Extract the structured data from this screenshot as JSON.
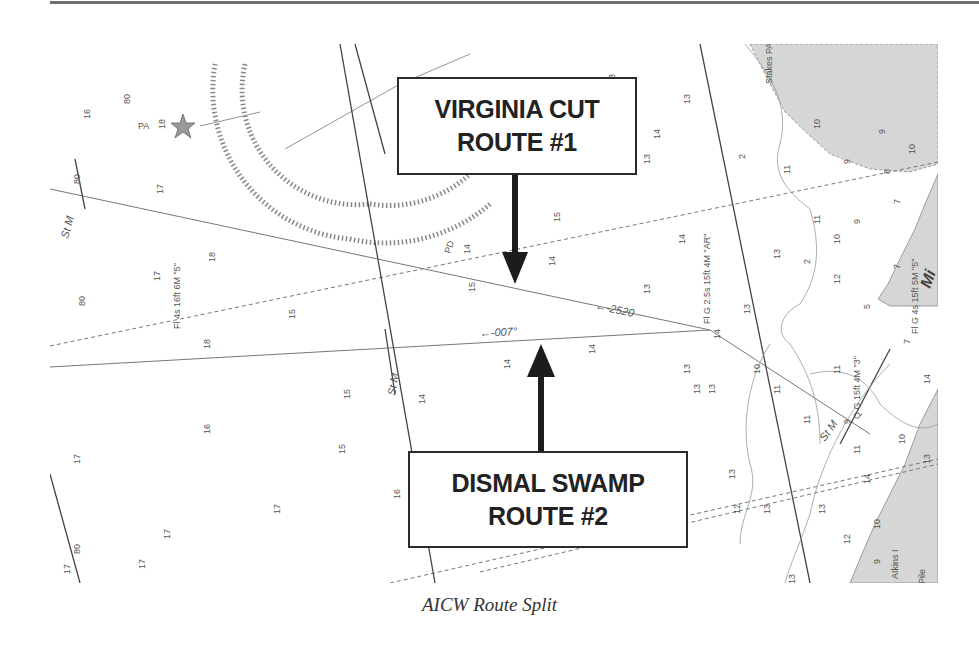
{
  "figure": {
    "caption": "AICW Route Split",
    "colors": {
      "land": "#d6d6d6",
      "water": "#ffffff",
      "ink": "#222222",
      "rule": "#6f6f6f"
    }
  },
  "callouts": [
    {
      "id": "route1",
      "line1": "VIRGINIA CUT",
      "line2": "ROUTE #1",
      "arrow": "down"
    },
    {
      "id": "route2",
      "line1": "DISMAL SWAMP",
      "line2": "ROUTE #2",
      "arrow": "up"
    }
  ],
  "chart_labels": {
    "bearing_1": "←-2520",
    "bearing_2": "←-007°",
    "light_1": "Fl 4s 16ft 6M \"5\"",
    "light_2": "Fl G 2.5s 15ft 4M \"AR\"",
    "light_3": "Q G 15ft 4M \"3\"",
    "light_4": "Fl G 4s 15ft 5M \"5\"",
    "place_1": "Stakes PA",
    "place_2": "Mi",
    "place_3": "Atkins I",
    "stm_1": "St M",
    "stm_2": "St M",
    "stm_3": "St M",
    "pile": "Pile",
    "pa_1": "PA",
    "pd_1": "PD"
  },
  "soundings": [
    {
      "x": 80,
      "y": 60,
      "t": "80"
    },
    {
      "x": 40,
      "y": 75,
      "t": "16"
    },
    {
      "x": 115,
      "y": 85,
      "t": "18"
    },
    {
      "x": 113,
      "y": 150,
      "t": "17"
    },
    {
      "x": 30,
      "y": 140,
      "t": "80"
    },
    {
      "x": 165,
      "y": 218,
      "t": "18"
    },
    {
      "x": 110,
      "y": 237,
      "t": "17"
    },
    {
      "x": 35,
      "y": 262,
      "t": "80"
    },
    {
      "x": 245,
      "y": 275,
      "t": "15"
    },
    {
      "x": 160,
      "y": 305,
      "t": "18"
    },
    {
      "x": 420,
      "y": 210,
      "t": "14"
    },
    {
      "x": 510,
      "y": 178,
      "t": "15"
    },
    {
      "x": 505,
      "y": 222,
      "t": "14"
    },
    {
      "x": 425,
      "y": 248,
      "t": "15"
    },
    {
      "x": 600,
      "y": 250,
      "t": "13"
    },
    {
      "x": 635,
      "y": 200,
      "t": "14"
    },
    {
      "x": 600,
      "y": 120,
      "t": "13"
    },
    {
      "x": 610,
      "y": 95,
      "t": "14"
    },
    {
      "x": 640,
      "y": 60,
      "t": "13"
    },
    {
      "x": 565,
      "y": 40,
      "t": "13"
    },
    {
      "x": 545,
      "y": 310,
      "t": "14"
    },
    {
      "x": 640,
      "y": 330,
      "t": "13"
    },
    {
      "x": 650,
      "y": 350,
      "t": "13"
    },
    {
      "x": 460,
      "y": 325,
      "t": "14"
    },
    {
      "x": 375,
      "y": 360,
      "t": "14"
    },
    {
      "x": 160,
      "y": 390,
      "t": "16"
    },
    {
      "x": 300,
      "y": 355,
      "t": "15"
    },
    {
      "x": 295,
      "y": 410,
      "t": "15"
    },
    {
      "x": 350,
      "y": 455,
      "t": "16"
    },
    {
      "x": 230,
      "y": 470,
      "t": "17"
    },
    {
      "x": 120,
      "y": 495,
      "t": "17"
    },
    {
      "x": 30,
      "y": 420,
      "t": "17"
    },
    {
      "x": 30,
      "y": 510,
      "t": "80"
    },
    {
      "x": 20,
      "y": 530,
      "t": "17"
    },
    {
      "x": 95,
      "y": 525,
      "t": "17"
    },
    {
      "x": 610,
      "y": 450,
      "t": "13"
    },
    {
      "x": 685,
      "y": 435,
      "t": "13"
    },
    {
      "x": 690,
      "y": 470,
      "t": "12"
    },
    {
      "x": 720,
      "y": 470,
      "t": "13"
    },
    {
      "x": 745,
      "y": 540,
      "t": "13"
    },
    {
      "x": 710,
      "y": 330,
      "t": "10"
    },
    {
      "x": 730,
      "y": 350,
      "t": "11"
    },
    {
      "x": 760,
      "y": 380,
      "t": "11"
    },
    {
      "x": 695,
      "y": 115,
      "t": "2"
    },
    {
      "x": 740,
      "y": 130,
      "t": "11"
    },
    {
      "x": 770,
      "y": 85,
      "t": "10"
    },
    {
      "x": 800,
      "y": 120,
      "t": "9"
    },
    {
      "x": 835,
      "y": 90,
      "t": "9"
    },
    {
      "x": 840,
      "y": 130,
      "t": "8"
    },
    {
      "x": 865,
      "y": 110,
      "t": "10"
    },
    {
      "x": 850,
      "y": 160,
      "t": "7"
    },
    {
      "x": 810,
      "y": 180,
      "t": "9"
    },
    {
      "x": 770,
      "y": 180,
      "t": "11"
    },
    {
      "x": 790,
      "y": 200,
      "t": "10"
    },
    {
      "x": 760,
      "y": 220,
      "t": "2"
    },
    {
      "x": 730,
      "y": 215,
      "t": "13"
    },
    {
      "x": 790,
      "y": 240,
      "t": "12"
    },
    {
      "x": 820,
      "y": 265,
      "t": "5"
    },
    {
      "x": 850,
      "y": 225,
      "t": "7"
    },
    {
      "x": 860,
      "y": 300,
      "t": "7"
    },
    {
      "x": 790,
      "y": 330,
      "t": "11"
    },
    {
      "x": 800,
      "y": 380,
      "t": "9"
    },
    {
      "x": 810,
      "y": 410,
      "t": "11"
    },
    {
      "x": 820,
      "y": 440,
      "t": "14"
    },
    {
      "x": 775,
      "y": 470,
      "t": "13"
    },
    {
      "x": 800,
      "y": 500,
      "t": "12"
    },
    {
      "x": 830,
      "y": 485,
      "t": "10"
    },
    {
      "x": 830,
      "y": 520,
      "t": "9"
    },
    {
      "x": 855,
      "y": 400,
      "t": "10"
    },
    {
      "x": 880,
      "y": 420,
      "t": "13"
    },
    {
      "x": 880,
      "y": 340,
      "t": "14"
    },
    {
      "x": 665,
      "y": 350,
      "t": "13"
    },
    {
      "x": 700,
      "y": 270,
      "t": "13"
    },
    {
      "x": 670,
      "y": 295,
      "t": "14"
    }
  ]
}
